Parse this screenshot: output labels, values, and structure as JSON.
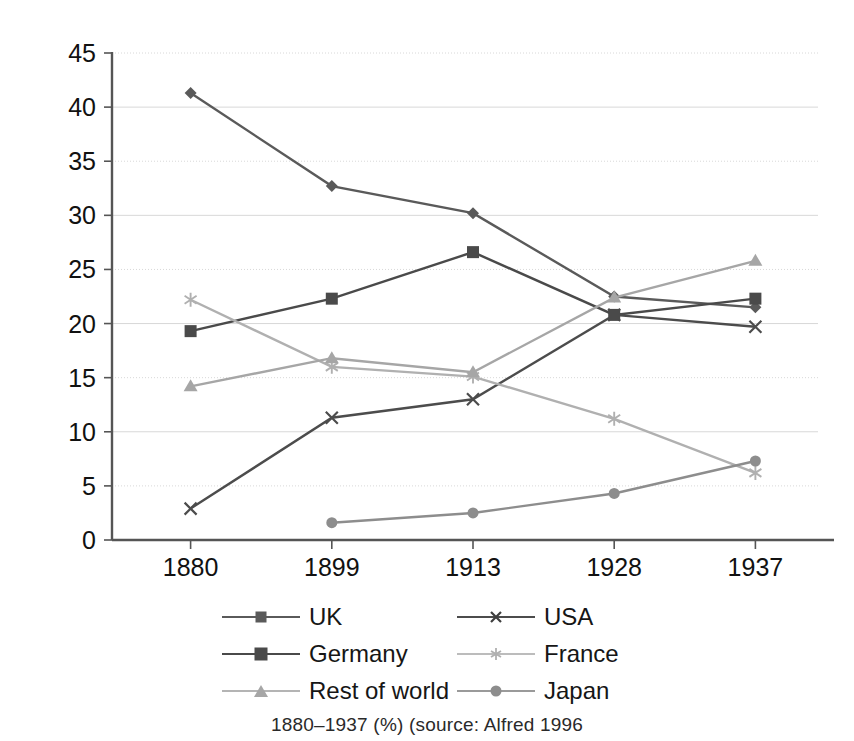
{
  "chart_data": {
    "type": "line",
    "title": "",
    "xlabel": "",
    "ylabel": "",
    "categories": [
      "1880",
      "1899",
      "1913",
      "1928",
      "1937"
    ],
    "ylim": [
      0,
      45
    ],
    "ytick_step": 5,
    "yticks": [
      "0",
      "5",
      "10",
      "15",
      "20",
      "25",
      "30",
      "35",
      "40",
      "45"
    ],
    "grid": true,
    "grid_axis": "y",
    "legend_position": "bottom",
    "series": [
      {
        "name": "UK",
        "marker": "diamond",
        "color": "#5a5a5a",
        "values": [
          41.3,
          32.7,
          30.2,
          22.5,
          21.5
        ]
      },
      {
        "name": "USA",
        "marker": "cross",
        "color": "#4c4c4c",
        "values": [
          2.9,
          11.3,
          13.0,
          20.8,
          19.7
        ]
      },
      {
        "name": "Germany",
        "marker": "square",
        "color": "#4a4a4a",
        "values": [
          19.3,
          22.3,
          26.6,
          20.8,
          22.3
        ]
      },
      {
        "name": "France",
        "marker": "star",
        "color": "#b0b0b0",
        "values": [
          22.2,
          16.0,
          15.1,
          11.2,
          6.2
        ]
      },
      {
        "name": "Rest of world",
        "marker": "triangle",
        "color": "#a6a6a6",
        "values": [
          14.2,
          16.8,
          15.5,
          22.4,
          25.8
        ]
      },
      {
        "name": "Japan",
        "marker": "circle",
        "color": "#8d8d8d",
        "values": [
          null,
          1.6,
          2.5,
          4.3,
          7.3
        ]
      }
    ]
  },
  "legend": {
    "items": [
      {
        "label": "UK"
      },
      {
        "label": "USA"
      },
      {
        "label": "Germany"
      },
      {
        "label": "France"
      },
      {
        "label": "Rest of world"
      },
      {
        "label": "Japan"
      }
    ]
  },
  "caption": {
    "text": "1880–1937 (%) (source: Alfred 1996"
  },
  "colors": {
    "axis": "#555555",
    "gridline": "#d8d8d8",
    "text": "#111111",
    "background": "#ffffff"
  }
}
